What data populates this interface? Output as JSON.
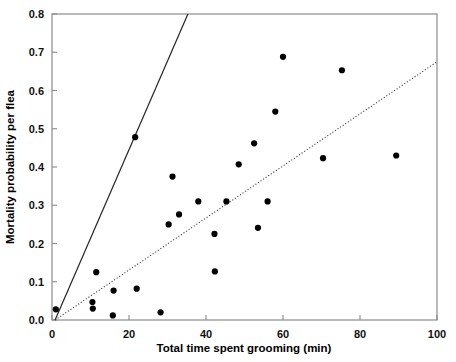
{
  "chart_data": {
    "type": "scatter",
    "title": "",
    "xlabel": "Total time spent grooming (min)",
    "ylabel": "Mortality probability per flea",
    "xlim": [
      0,
      100
    ],
    "ylim": [
      0.0,
      0.8
    ],
    "xticks": [
      0,
      20,
      40,
      60,
      80,
      100
    ],
    "xtick_labels": [
      "0",
      "20",
      "40",
      "60",
      "80",
      "100"
    ],
    "yticks": [
      0.0,
      0.1,
      0.2,
      0.3,
      0.4,
      0.5,
      0.6,
      0.7,
      0.8
    ],
    "ytick_labels": [
      "0.0",
      "0.1",
      "0.2",
      "0.3",
      "0.4",
      "0.5",
      "0.6",
      "0.7",
      "0.8"
    ],
    "grid": false,
    "legend": null,
    "marker": "filled-circle",
    "marker_color": "#000000",
    "points": [
      {
        "x": 1.0,
        "y": 0.028
      },
      {
        "x": 10.5,
        "y": 0.047
      },
      {
        "x": 10.6,
        "y": 0.03
      },
      {
        "x": 11.5,
        "y": 0.125
      },
      {
        "x": 15.8,
        "y": 0.012
      },
      {
        "x": 16.0,
        "y": 0.077
      },
      {
        "x": 21.6,
        "y": 0.478
      },
      {
        "x": 22.0,
        "y": 0.082
      },
      {
        "x": 28.2,
        "y": 0.02
      },
      {
        "x": 30.3,
        "y": 0.25
      },
      {
        "x": 31.3,
        "y": 0.375
      },
      {
        "x": 33.0,
        "y": 0.276
      },
      {
        "x": 38.0,
        "y": 0.31
      },
      {
        "x": 42.2,
        "y": 0.225
      },
      {
        "x": 42.3,
        "y": 0.127
      },
      {
        "x": 45.3,
        "y": 0.31
      },
      {
        "x": 48.5,
        "y": 0.407
      },
      {
        "x": 52.5,
        "y": 0.462
      },
      {
        "x": 53.5,
        "y": 0.241
      },
      {
        "x": 56.0,
        "y": 0.31
      },
      {
        "x": 58.0,
        "y": 0.545
      },
      {
        "x": 60.0,
        "y": 0.688
      },
      {
        "x": 70.4,
        "y": 0.423
      },
      {
        "x": 75.3,
        "y": 0.653
      },
      {
        "x": 89.4,
        "y": 0.43
      }
    ],
    "lines": [
      {
        "name": "solid-fit-line",
        "style": "solid",
        "color": "#2b2b2b",
        "x0": 0.8,
        "y0": 0.0,
        "x1": 35.3,
        "y1": 0.8
      },
      {
        "name": "dotted-fit-line",
        "style": "dotted",
        "color": "#3a3a3a",
        "x0": 0.8,
        "y0": 0.0,
        "x1": 100.0,
        "y1": 0.675
      }
    ]
  },
  "axes": {
    "x_title": "Total time spent grooming (min)",
    "y_title": "Mortality probability per flea"
  }
}
